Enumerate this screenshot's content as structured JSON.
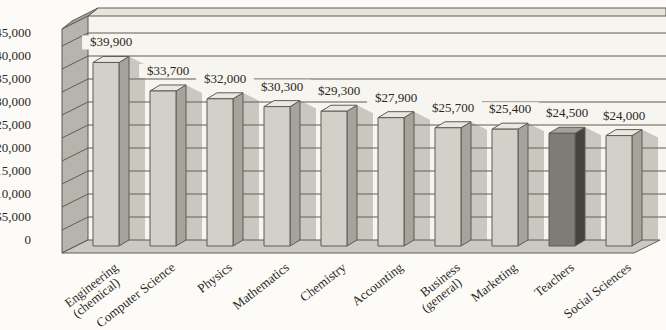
{
  "chart_data": {
    "type": "bar",
    "variant": "3d-column",
    "title": "",
    "xlabel": "",
    "ylabel": "",
    "categories": [
      "Engineering (chemical)",
      "Computer Science",
      "Physics",
      "Mathematics",
      "Chemistry",
      "Accounting",
      "Business (general)",
      "Marketing",
      "Teachers",
      "Social Sciences"
    ],
    "values": [
      39900,
      33700,
      32000,
      30300,
      29300,
      27900,
      25700,
      25400,
      24500,
      24000
    ],
    "value_labels": [
      "$39,900",
      "$33,700",
      "$32,000",
      "$30,300",
      "$29,300",
      "$27,900",
      "$25,700",
      "$25,400",
      "$24,500",
      "$24,000"
    ],
    "tick_values": [
      0,
      5000,
      10000,
      15000,
      20000,
      25000,
      30000,
      35000,
      40000,
      45000
    ],
    "tick_labels": [
      "0",
      "$5,000",
      "$10,000",
      "$15,000",
      "$20,000",
      "$25,000",
      "$30,000",
      "$35,000",
      "$40,000",
      "$45,000"
    ],
    "ylim": [
      0,
      45000
    ],
    "grid": true,
    "legend": false,
    "highlighted_category": "Teachers",
    "highlighted_index": 8,
    "colors": {
      "bar_front": "#d2d0c9",
      "bar_top": "#e9e7e0",
      "bar_side": "#a5a39c",
      "highlight_front": "#7e7c76",
      "highlight_top": "#a3a19b",
      "highlight_side": "#45433e",
      "wall": "#f7f5ef",
      "wall_bevel": "#e6e4dd",
      "wall_corner": "#a8a6a0",
      "left_wall": "#b7b4ad",
      "floor": "#cbc9c2",
      "shadow": "rgba(110,106,98,0.33)",
      "line": "#5f5b53",
      "text": "#2b2722"
    }
  }
}
